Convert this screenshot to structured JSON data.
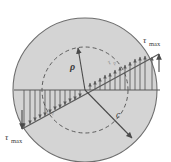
{
  "figure": {
    "name": "torsion-shear-stress-distribution",
    "type": "engineering-diagram",
    "background_color": "#ffffff",
    "cross_section": {
      "label": "circular-cross-section",
      "fill_color": "#d4d4d4",
      "stroke_color": "#6e6e6e",
      "center": {
        "x": 85,
        "y": 90
      },
      "radius": 72
    },
    "inner_dashed_circle": {
      "label": "radius-rho-circle",
      "stroke_color": "#555555",
      "dash": "4 3",
      "radius": 43
    },
    "labels": {
      "tau_max_top_right": "τ",
      "tau_max_top_right_sub": "max",
      "tau_max_bottom_left": "τ",
      "tau_max_bottom_left_sub": "max",
      "rho": "ρ",
      "c": "c",
      "tau_rho_right": "τ",
      "tau_rho_right_sub": "ρ",
      "tau_rho_left": "τ",
      "tau_rho_left_sub": "ρ"
    },
    "radius_arrow_rho": {
      "name": "rho-radius-arrow",
      "from": {
        "x": 85,
        "y": 90
      },
      "to": {
        "x": 78,
        "y": 47
      }
    },
    "radius_arrow_c": {
      "name": "c-radius-arrow",
      "from": {
        "x": 85,
        "y": 90
      },
      "to": {
        "x": 134,
        "y": 140
      }
    },
    "stress_distribution": {
      "name": "linear-shear-stress-profile",
      "description": "Shear stress varies linearly from zero at the center to tau-max at the outer surface",
      "axis_line": {
        "x1": 14,
        "y1": 90,
        "x2": 158,
        "y2": 90
      },
      "envelope_line": {
        "x1": 24,
        "y1": 128,
        "x2": 160,
        "y2": 55
      },
      "tick_count_left": 13,
      "tick_count_right": 13,
      "stroke_color": "#555555"
    }
  }
}
